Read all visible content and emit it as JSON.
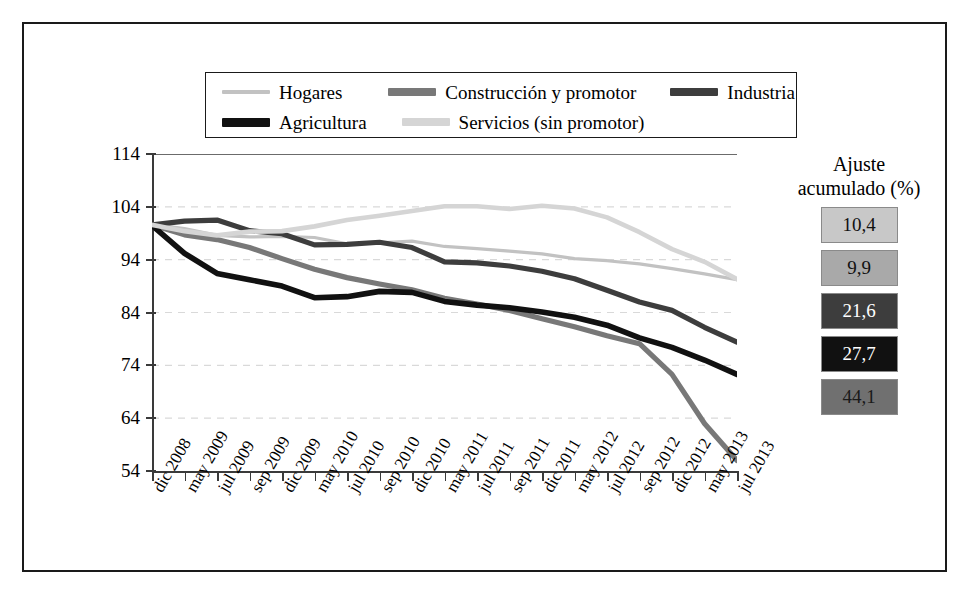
{
  "chart_data": {
    "type": "line",
    "title": "",
    "xlabel": "",
    "ylabel": "",
    "ylim": [
      54,
      114
    ],
    "yticks": [
      54,
      64,
      74,
      84,
      94,
      104,
      114
    ],
    "grid": true,
    "legend_position": "top",
    "categories": [
      "dic 2008",
      "may 2009",
      "jul 2009",
      "sep 2009",
      "dic 2009",
      "may 2010",
      "jul 2010",
      "sep 2010",
      "dic 2010",
      "may 2011",
      "jul 2011",
      "sep 2011",
      "dic 2011",
      "may 2012",
      "jul 2012",
      "sep 2012",
      "dic 2012",
      "may 2013",
      "jul 2013"
    ],
    "series": [
      {
        "name": "Hogares",
        "color": "#c2c2c2",
        "width": 3.2,
        "values": [
          100.7,
          99.9,
          98.6,
          98.3,
          98.4,
          98.2,
          97.0,
          97.2,
          97.5,
          96.5,
          96.1,
          95.6,
          95.1,
          94.2,
          93.8,
          93.2,
          92.3,
          91.3,
          90.2
        ]
      },
      {
        "name": "Construcción y promotor",
        "color": "#787878",
        "width": 5.2,
        "values": [
          100.6,
          98.7,
          97.8,
          96.3,
          94.2,
          92.2,
          90.6,
          89.4,
          88.3,
          86.7,
          85.6,
          84.4,
          82.8,
          81.3,
          79.6,
          78.1,
          72.3,
          63.0,
          56.0
        ]
      },
      {
        "name": "Industria",
        "color": "#3d3d3d",
        "width": 5.2,
        "values": [
          100.6,
          101.3,
          101.5,
          99.5,
          98.9,
          96.8,
          96.9,
          97.3,
          96.3,
          93.6,
          93.4,
          92.8,
          91.8,
          90.4,
          88.2,
          86.0,
          84.4,
          81.2,
          78.4
        ]
      },
      {
        "name": "Agricultura",
        "color": "#111111",
        "width": 5.6,
        "values": [
          100.5,
          95.2,
          91.4,
          90.2,
          89.0,
          86.8,
          87.0,
          88.0,
          87.8,
          86.1,
          85.4,
          84.9,
          84.1,
          83.1,
          81.6,
          79.2,
          77.4,
          75.0,
          72.3
        ]
      },
      {
        "name": "Servicios (sin promotor)",
        "color": "#d5d5d5",
        "width": 4.6,
        "values": [
          100.6,
          99.4,
          98.6,
          99.3,
          99.4,
          100.3,
          101.5,
          102.3,
          103.2,
          104.1,
          104.1,
          103.6,
          104.2,
          103.7,
          102.0,
          99.2,
          96.0,
          93.6,
          90.3
        ]
      }
    ]
  },
  "legend": {
    "items": [
      {
        "label": "Hogares",
        "color": "#c2c2c2",
        "thickness": 4
      },
      {
        "label": "Construcción y promotor",
        "color": "#787878",
        "thickness": 8
      },
      {
        "label": "Industria",
        "color": "#3d3d3d",
        "thickness": 8
      },
      {
        "label": "Agricultura",
        "color": "#111111",
        "thickness": 9
      },
      {
        "label": "Servicios (sin promotor)",
        "color": "#d5d5d5",
        "thickness": 8
      }
    ]
  },
  "right_panel": {
    "title_line1": "Ajuste",
    "title_line2": "acumulado (%)",
    "boxes": [
      {
        "value": "10,4",
        "bg": "#c8c8c8",
        "fg": "#111111"
      },
      {
        "value": "9,9",
        "bg": "#a9a9a9",
        "fg": "#111111"
      },
      {
        "value": "21,6",
        "bg": "#3d3d3d",
        "fg": "#ffffff"
      },
      {
        "value": "27,7",
        "bg": "#111111",
        "fg": "#ffffff"
      },
      {
        "value": "44,1",
        "bg": "#707070",
        "fg": "#1a1a1a"
      }
    ]
  }
}
